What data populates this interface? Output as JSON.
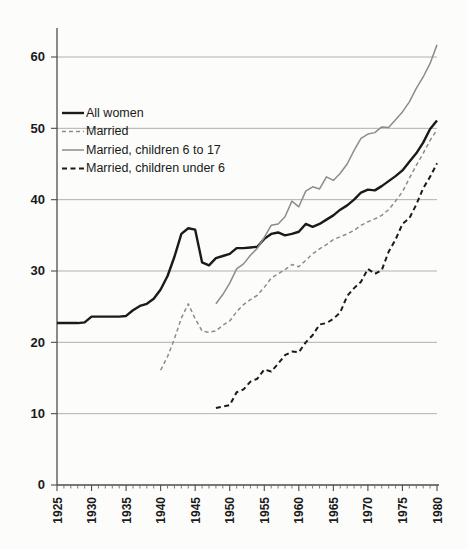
{
  "chart_data": {
    "type": "line",
    "title": "",
    "subtitle": "",
    "xlabel": "",
    "ylabel": "",
    "xlim": [
      1925,
      1980
    ],
    "ylim": [
      0,
      65
    ],
    "grid": true,
    "legend_position": "upper-left-inside",
    "yticks": [
      0,
      10,
      20,
      30,
      40,
      50,
      60
    ],
    "ytick_labels": [
      "0",
      "10",
      "20",
      "30",
      "40",
      "50",
      "60"
    ],
    "xticks": [
      1925,
      1930,
      1935,
      1940,
      1945,
      1950,
      1955,
      1960,
      1965,
      1970,
      1975,
      1980
    ],
    "xtick_labels": [
      "1925",
      "1930",
      "1935",
      "1940",
      "1945",
      "1950",
      "1955",
      "1960",
      "1965",
      "1970",
      "1975",
      "1980"
    ],
    "series": [
      {
        "name": "All women",
        "style": "solid",
        "color": "#1a1a1a",
        "width": 2.4,
        "x": [
          1925,
          1926,
          1927,
          1928,
          1929,
          1930,
          1931,
          1932,
          1933,
          1934,
          1935,
          1936,
          1937,
          1938,
          1939,
          1940,
          1941,
          1942,
          1943,
          1944,
          1945,
          1946,
          1947,
          1948,
          1949,
          1950,
          1951,
          1952,
          1953,
          1954,
          1955,
          1956,
          1957,
          1958,
          1959,
          1960,
          1961,
          1962,
          1963,
          1964,
          1965,
          1966,
          1967,
          1968,
          1969,
          1970,
          1971,
          1972,
          1973,
          1974,
          1975,
          1976,
          1977,
          1978,
          1979,
          1980
        ],
        "y": [
          22.7,
          22.7,
          22.7,
          22.7,
          22.8,
          23.6,
          23.6,
          23.6,
          23.6,
          23.6,
          23.7,
          24.5,
          25.1,
          25.4,
          26.1,
          27.4,
          29.3,
          32.0,
          35.2,
          36.0,
          35.8,
          31.2,
          30.8,
          31.8,
          32.1,
          32.4,
          33.2,
          33.2,
          33.3,
          33.4,
          34.5,
          35.2,
          35.4,
          35.0,
          35.2,
          35.5,
          36.6,
          36.2,
          36.6,
          37.2,
          37.8,
          38.6,
          39.2,
          40.0,
          41.0,
          41.4,
          41.3,
          41.9,
          42.6,
          43.3,
          44.1,
          45.3,
          46.5,
          48.0,
          49.9,
          51.1
        ]
      },
      {
        "name": "Married",
        "style": "dashed",
        "color": "#8c8c8c",
        "width": 1.5,
        "x": [
          1940,
          1941,
          1942,
          1943,
          1944,
          1945,
          1946,
          1947,
          1948,
          1949,
          1950,
          1951,
          1952,
          1953,
          1954,
          1955,
          1956,
          1957,
          1958,
          1959,
          1960,
          1961,
          1962,
          1963,
          1964,
          1965,
          1966,
          1967,
          1968,
          1969,
          1970,
          1971,
          1972,
          1973,
          1974,
          1975,
          1976,
          1977,
          1978,
          1979,
          1980
        ],
        "y": [
          16.1,
          18.0,
          20.5,
          23.4,
          25.4,
          23.3,
          21.6,
          21.4,
          21.6,
          22.4,
          23.0,
          24.3,
          25.3,
          26.0,
          26.6,
          27.7,
          29.0,
          29.6,
          30.2,
          30.9,
          30.6,
          31.5,
          32.4,
          33.1,
          33.7,
          34.4,
          34.8,
          35.2,
          35.7,
          36.4,
          36.9,
          37.3,
          37.8,
          38.6,
          39.8,
          41.1,
          43.0,
          44.8,
          46.5,
          48.3,
          49.8
        ]
      },
      {
        "name": "Married, children 6 to 17",
        "style": "solid",
        "color": "#8c8c8c",
        "width": 1.5,
        "x": [
          1948,
          1949,
          1950,
          1951,
          1952,
          1953,
          1954,
          1955,
          1956,
          1957,
          1958,
          1959,
          1960,
          1961,
          1962,
          1963,
          1964,
          1965,
          1966,
          1967,
          1968,
          1969,
          1970,
          1971,
          1972,
          1973,
          1974,
          1975,
          1976,
          1977,
          1978,
          1979,
          1980
        ],
        "y": [
          25.4,
          26.7,
          28.3,
          30.3,
          31.0,
          32.2,
          33.2,
          34.7,
          36.4,
          36.6,
          37.6,
          39.8,
          39.0,
          41.2,
          41.8,
          41.5,
          43.2,
          42.7,
          43.7,
          45.0,
          46.9,
          48.6,
          49.2,
          49.4,
          50.2,
          50.1,
          51.2,
          52.3,
          53.7,
          55.6,
          57.2,
          59.1,
          61.7
        ]
      },
      {
        "name": "Married, children under 6",
        "style": "dashed",
        "color": "#1a1a1a",
        "width": 2.0,
        "x": [
          1948,
          1949,
          1950,
          1951,
          1952,
          1953,
          1954,
          1955,
          1956,
          1957,
          1958,
          1959,
          1960,
          1961,
          1962,
          1963,
          1964,
          1965,
          1966,
          1967,
          1968,
          1969,
          1970,
          1971,
          1972,
          1973,
          1974,
          1975,
          1976,
          1977,
          1978,
          1979,
          1980
        ],
        "y": [
          10.8,
          11.0,
          11.2,
          13.0,
          13.4,
          14.5,
          14.9,
          16.2,
          15.9,
          17.0,
          18.2,
          18.7,
          18.6,
          20.0,
          21.0,
          22.5,
          22.7,
          23.3,
          24.2,
          26.5,
          27.6,
          28.5,
          30.3,
          29.6,
          30.1,
          32.7,
          34.4,
          36.6,
          37.4,
          39.3,
          41.6,
          43.2,
          45.1
        ]
      }
    ]
  },
  "legend": {
    "items": [
      {
        "label": "All women"
      },
      {
        "label": "Married"
      },
      {
        "label": "Married, children 6 to 17"
      },
      {
        "label": "Married, children under 6"
      }
    ]
  }
}
